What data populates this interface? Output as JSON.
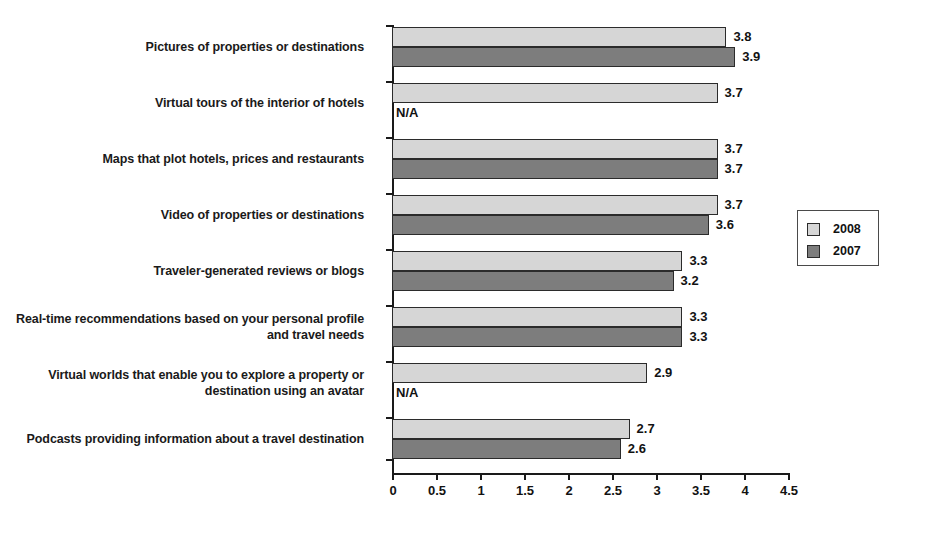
{
  "chart_data": {
    "type": "bar",
    "orientation": "horizontal",
    "title": "",
    "xlabel": "",
    "ylabel": "",
    "xlim": [
      0,
      4.5
    ],
    "xticks": [
      0,
      0.5,
      1,
      1.5,
      2,
      2.5,
      3,
      3.5,
      4,
      4.5
    ],
    "xtick_labels": [
      "0",
      "0.5",
      "1",
      "1.5",
      "2",
      "2.5",
      "3",
      "3.5",
      "4",
      "4.5"
    ],
    "grid": false,
    "legend_position": "right",
    "categories": [
      "Pictures of properties or destinations",
      "Virtual tours of the interior of hotels",
      "Maps that plot hotels, prices and restaurants",
      "Video of properties or destinations",
      "Traveler-generated reviews or blogs",
      "Real-time recommendations based on your personal profile and travel needs",
      "Virtual worlds that enable you to explore a property or destination using an avatar",
      "Podcasts providing information about a travel destination"
    ],
    "series": [
      {
        "name": "2008",
        "color": "#d6d6d6",
        "values": [
          3.8,
          3.7,
          3.7,
          3.7,
          3.3,
          3.3,
          2.9,
          2.7
        ],
        "labels": [
          "3.8",
          "3.7",
          "3.7",
          "3.7",
          "3.3",
          "3.3",
          "2.9",
          "2.7"
        ]
      },
      {
        "name": "2007",
        "color": "#7d7d7d",
        "values": [
          3.9,
          null,
          3.7,
          3.6,
          3.2,
          3.3,
          null,
          2.6
        ],
        "labels": [
          "3.9",
          "N/A",
          "3.7",
          "3.6",
          "3.2",
          "3.3",
          "N/A",
          "2.6"
        ]
      }
    ],
    "na_text": "N/A"
  },
  "legend": {
    "entries": [
      {
        "label": "2008",
        "color": "#d6d6d6"
      },
      {
        "label": "2007",
        "color": "#7d7d7d"
      }
    ]
  }
}
